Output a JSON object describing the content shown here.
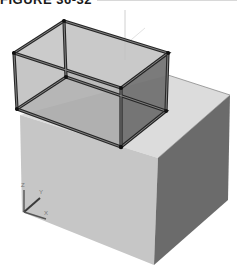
{
  "figure": {
    "label": "FIGURE 36-32"
  },
  "ucs_icon": {
    "x_label": "X",
    "y_label": "Y",
    "z_label": "Z"
  },
  "colors": {
    "solid_front": "#c9c9c9",
    "solid_top": "#dcdcdc",
    "solid_side": "#6a6a6a",
    "wire_edge": "#2b2b2b",
    "wire_face_light": "#b8b8b8",
    "wire_face_dark": "#7a7a7a"
  }
}
